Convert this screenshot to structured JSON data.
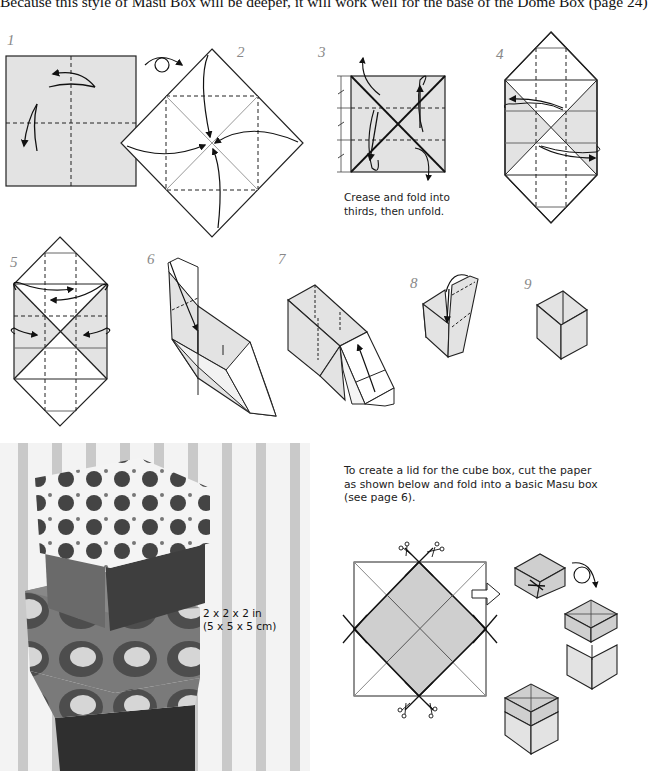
{
  "intro_text": "Because this style of Masu Box will be deeper, it will work well for the base of the Dome Box (page 24)",
  "steps": [
    {
      "number": "1",
      "diagram": "square-with-crease-lines-and-fold-arrows"
    },
    {
      "number": "2",
      "diagram": "diamond-fold-corners-to-center"
    },
    {
      "number": "3",
      "diagram": "crease-into-thirds",
      "caption_line1": "Crease and fold into",
      "caption_line2": "thirds, then unfold."
    },
    {
      "number": "4",
      "diagram": "hexagon-fold-flaps"
    },
    {
      "number": "5",
      "diagram": "hexagon-fold-sides-in"
    },
    {
      "number": "6",
      "diagram": "raise-walls-3d"
    },
    {
      "number": "7",
      "diagram": "tuck-flap-3d"
    },
    {
      "number": "8",
      "diagram": "fold-last-wall-3d"
    },
    {
      "number": "9",
      "diagram": "finished-cube-box"
    }
  ],
  "photo": {
    "description": "stack-of-two-patterned-cube-boxes",
    "size_line1": "2 x 2 x 2 in",
    "size_line2": "(5 x 5 x 5 cm)"
  },
  "lid_section": {
    "text_line1": "To create a lid for the cube box, cut the paper",
    "text_line2": "as shown below and fold into a basic Masu box",
    "text_line3": "(see page 6)."
  },
  "colors": {
    "paper_gray": "#e3e3e3",
    "lid_gray": "#cfcfcf",
    "line": "#1a1a1a",
    "step_number": "#888888"
  }
}
